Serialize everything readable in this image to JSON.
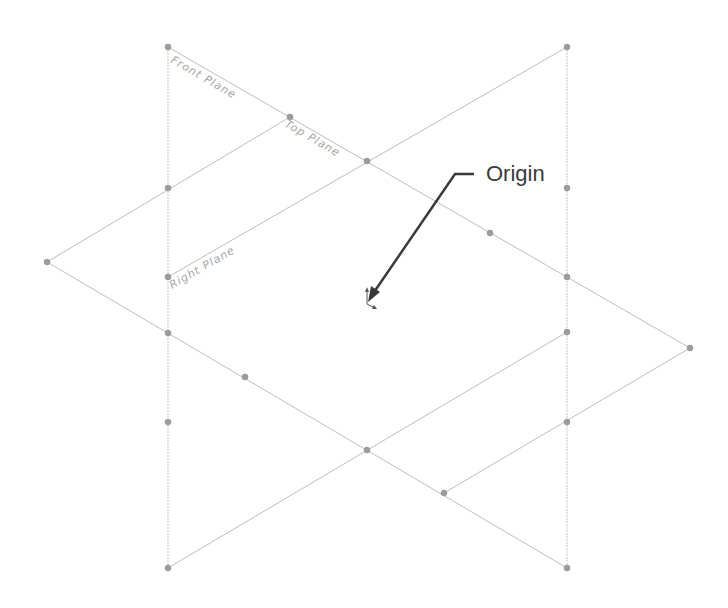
{
  "diagram": {
    "labels": {
      "front_plane": "Front Plane",
      "top_plane": "Top Plane",
      "right_plane": "Right Plane",
      "origin": "Origin"
    },
    "colors": {
      "edge": "#bdbdbd",
      "node": "#9c9c9c",
      "plane_label": "#a6a6a6",
      "callout": "#3a3a3a"
    },
    "nodes": [
      [
        168,
        47
      ],
      [
        567,
        47
      ],
      [
        290,
        117
      ],
      [
        367,
        161
      ],
      [
        168,
        188
      ],
      [
        567,
        188
      ],
      [
        490,
        233
      ],
      [
        47,
        262
      ],
      [
        168,
        277
      ],
      [
        567,
        277
      ],
      [
        168,
        333
      ],
      [
        567,
        332
      ],
      [
        690,
        348
      ],
      [
        245,
        377
      ],
      [
        168,
        422
      ],
      [
        567,
        422
      ],
      [
        367,
        450
      ],
      [
        444,
        493
      ],
      [
        168,
        568
      ],
      [
        567,
        568
      ]
    ],
    "origin_point": [
      367,
      303
    ]
  }
}
